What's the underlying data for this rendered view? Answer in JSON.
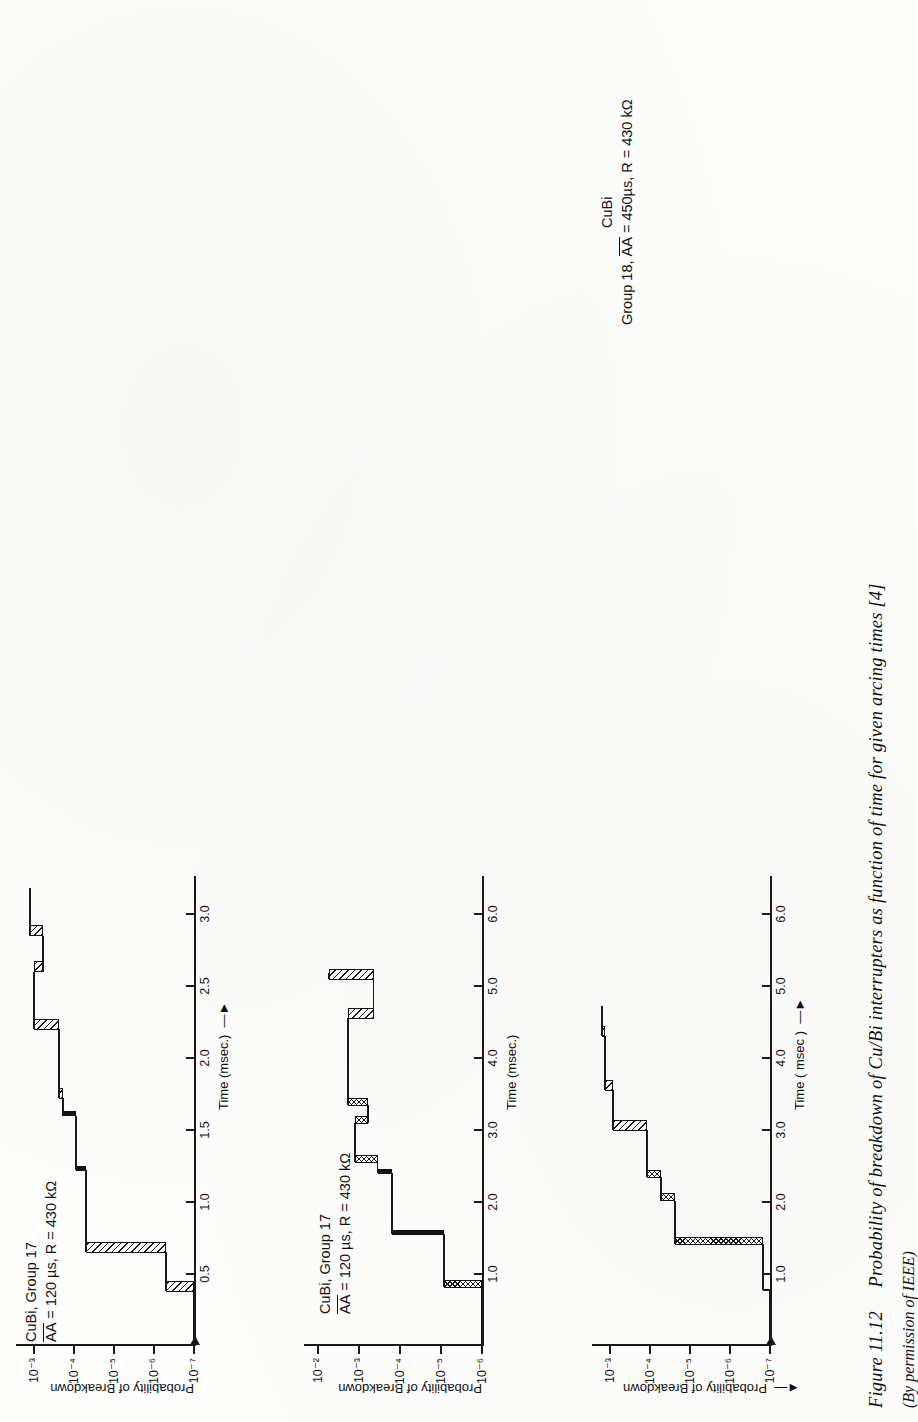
{
  "figure": {
    "number": "Figure 11.12",
    "caption": "Probability of breakdown of Cu/Bi interrupters as function of time for given arcing times [4]",
    "credit": "(By permission of IEEE)"
  },
  "common": {
    "y_axis_title": "Probability of Breakdown",
    "x_axis_title": "Time (msec.)",
    "x_axis_title_alt": "Time ( msec )",
    "arrow_glyph": "→",
    "arrow_left_glyph": "←"
  },
  "chart_data": [
    {
      "id": "chart-1",
      "type": "line",
      "title_line1": "CuBi, Group 17",
      "title_line2": "AA = 120 µs, R = 430 kΩ",
      "title_overline_token": "AA",
      "xlabel": "Time (msec.)",
      "ylabel": "Probability of Breakdown",
      "xlim": [
        0.0,
        3.25
      ],
      "ylim_exponents": [
        -7,
        -2.6
      ],
      "yticks": [
        "10⁻³",
        "10⁻⁴",
        "10⁻⁵",
        "10⁻⁶",
        "10⁻⁷"
      ],
      "ytick_exponents": [
        -3,
        -4,
        -5,
        -6,
        -7
      ],
      "xticks": [
        "0.5",
        "1.0",
        "1.5",
        "2.0",
        "2.5",
        "3.0"
      ],
      "xtick_values": [
        0.5,
        1.0,
        1.5,
        2.0,
        2.5,
        3.0
      ],
      "grid": false,
      "legend": "none",
      "note": "Descending staircase, probability decreasing with time; risers drawn as hatched or solid blocks.",
      "steps": [
        {
          "x_start": 0.0,
          "x_end": 0.38,
          "y_exp": -7.0,
          "riser_style": "none"
        },
        {
          "x_start": 0.38,
          "x_end": 0.65,
          "y_exp": -6.3,
          "riser_style": "hatch"
        },
        {
          "x_start": 0.65,
          "x_end": 1.22,
          "y_exp": -4.3,
          "riser_style": "hatch"
        },
        {
          "x_start": 1.22,
          "x_end": 1.6,
          "y_exp": -4.05,
          "riser_style": "solid"
        },
        {
          "x_start": 1.6,
          "x_end": 1.72,
          "y_exp": -3.72,
          "riser_style": "solid"
        },
        {
          "x_start": 1.72,
          "x_end": 2.2,
          "y_exp": -3.62,
          "riser_style": "hatch"
        },
        {
          "x_start": 2.2,
          "x_end": 2.6,
          "y_exp": -3.0,
          "riser_style": "hatch"
        },
        {
          "x_start": 2.6,
          "x_end": 2.85,
          "y_exp": -3.22,
          "riser_style": "hatch"
        },
        {
          "x_start": 2.85,
          "x_end": 3.18,
          "y_exp": -2.9,
          "riser_style": "hatch"
        }
      ]
    },
    {
      "id": "chart-2",
      "type": "line",
      "title_line1": "CuBi, Group 17",
      "title_line2": "AA = 120 µs, R = 430 kΩ",
      "title_overline_token": "AA",
      "xlabel": "Time (msec.)",
      "ylabel": "Probability of Breakdown",
      "xlim": [
        0.0,
        6.5
      ],
      "ylim_exponents": [
        -6,
        -1.7
      ],
      "yticks": [
        "10⁻²",
        "10⁻³",
        "10⁻⁴",
        "10⁻⁵",
        "10⁻⁶"
      ],
      "ytick_exponents": [
        -2,
        -3,
        -4,
        -5,
        -6
      ],
      "xticks": [
        "1.0",
        "2.0",
        "3.0",
        "4.0",
        "5.0",
        "6.0"
      ],
      "xtick_values": [
        1.0,
        2.0,
        3.0,
        4.0,
        5.0,
        6.0
      ],
      "grid": false,
      "legend": "none",
      "steps": [
        {
          "x_start": 0.0,
          "x_end": 0.82,
          "y_exp": -6.0,
          "riser_style": "none"
        },
        {
          "x_start": 0.82,
          "x_end": 1.55,
          "y_exp": -5.08,
          "riser_style": "cross"
        },
        {
          "x_start": 1.55,
          "x_end": 2.4,
          "y_exp": -3.8,
          "riser_style": "solid"
        },
        {
          "x_start": 2.4,
          "x_end": 2.55,
          "y_exp": -3.45,
          "riser_style": "solid"
        },
        {
          "x_start": 2.55,
          "x_end": 3.1,
          "y_exp": -2.9,
          "riser_style": "cross"
        },
        {
          "x_start": 3.1,
          "x_end": 3.35,
          "y_exp": -3.22,
          "riser_style": "cross"
        },
        {
          "x_start": 3.35,
          "x_end": 4.55,
          "y_exp": -2.72,
          "riser_style": "cross"
        },
        {
          "x_start": 4.55,
          "x_end": 5.1,
          "y_exp": -3.35,
          "riser_style": "hatch"
        },
        {
          "x_start": 5.1,
          "x_end": 5.18,
          "y_exp": -2.25,
          "riser_style": "hatch"
        }
      ]
    },
    {
      "id": "chart-3",
      "type": "line",
      "title_line1": "CuBi",
      "title_line2": "Group 18, AA = 450µs, R = 430 kΩ",
      "title_overline_token": "AA",
      "xlabel": "Time ( msec )",
      "ylabel": "Probability of Breakdown",
      "xlim": [
        0.0,
        6.5
      ],
      "ylim_exponents": [
        -7,
        -2.6
      ],
      "yticks": [
        "10⁻³",
        "10⁻⁴",
        "10⁻⁵",
        "10⁻⁶",
        "10⁻⁷"
      ],
      "ytick_exponents": [
        -3,
        -4,
        -5,
        -6,
        -7
      ],
      "xticks": [
        "1.0",
        "2.0",
        "3.0",
        "4.0",
        "5.0",
        "6.0"
      ],
      "xtick_values": [
        1.0,
        2.0,
        3.0,
        4.0,
        5.0,
        6.0
      ],
      "grid": false,
      "legend": "none",
      "steps": [
        {
          "x_start": 0.0,
          "x_end": 0.78,
          "y_exp": -7.0,
          "riser_style": "none"
        },
        {
          "x_start": 0.78,
          "x_end": 1.42,
          "y_exp": -6.82,
          "riser_style": "none"
        },
        {
          "x_start": 1.42,
          "x_end": 2.02,
          "y_exp": -4.62,
          "riser_style": "cross"
        },
        {
          "x_start": 2.02,
          "x_end": 2.35,
          "y_exp": -4.28,
          "riser_style": "cross"
        },
        {
          "x_start": 2.35,
          "x_end": 3.0,
          "y_exp": -3.92,
          "riser_style": "cross"
        },
        {
          "x_start": 3.0,
          "x_end": 3.55,
          "y_exp": -3.08,
          "riser_style": "hatch"
        },
        {
          "x_start": 3.55,
          "x_end": 4.3,
          "y_exp": -2.88,
          "riser_style": "hatch"
        },
        {
          "x_start": 4.3,
          "x_end": 4.72,
          "y_exp": -2.8,
          "riser_style": "hatch"
        }
      ]
    }
  ]
}
